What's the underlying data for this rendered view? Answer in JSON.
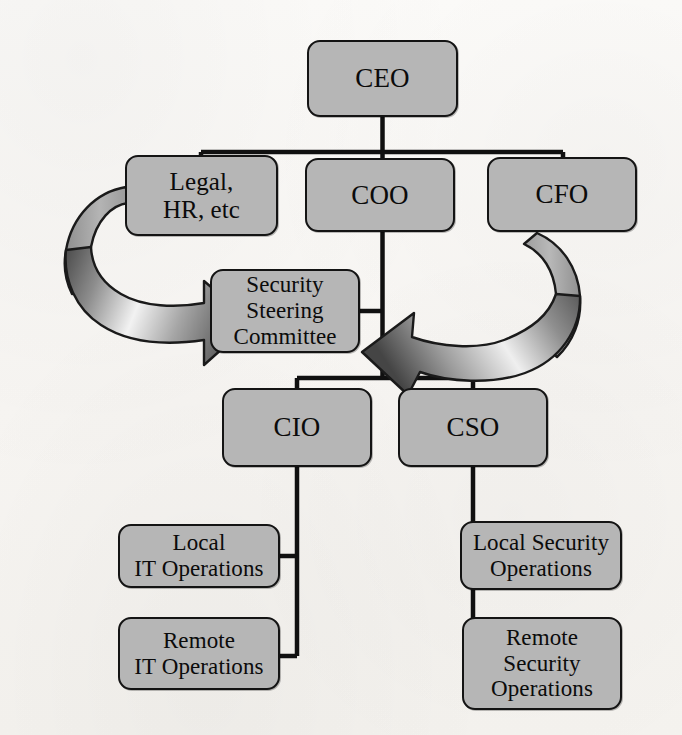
{
  "diagram": {
    "colors": {
      "node_fill": "#b6b6b6",
      "node_border": "#141414",
      "connector": "#101010",
      "arrow_outline": "#1a1a1a",
      "arrow_light": "#ffffff",
      "arrow_dark": "#3a3a3a",
      "background": "#fbfaf8"
    },
    "nodes": [
      {
        "id": "ceo",
        "label": "CEO",
        "level": 1
      },
      {
        "id": "legal",
        "label": "Legal,\nHR, etc",
        "level": 2
      },
      {
        "id": "coo",
        "label": "COO",
        "level": 2
      },
      {
        "id": "cfo",
        "label": "CFO",
        "level": 2
      },
      {
        "id": "ssc",
        "label": "Security\nSteering\nCommittee",
        "level": 3
      },
      {
        "id": "cio",
        "label": "CIO",
        "level": 4
      },
      {
        "id": "cso",
        "label": "CSO",
        "level": 4
      },
      {
        "id": "lit",
        "label": "Local\nIT Operations",
        "level": 5
      },
      {
        "id": "rit",
        "label": "Remote\nIT Operations",
        "level": 5
      },
      {
        "id": "lso",
        "label": "Local Security\nOperations",
        "level": 5
      },
      {
        "id": "rso",
        "label": "Remote\nSecurity\nOperations",
        "level": 5
      }
    ],
    "connectors": [
      {
        "from": "ceo",
        "to": "legal",
        "type": "orthogonal"
      },
      {
        "from": "ceo",
        "to": "coo",
        "type": "orthogonal"
      },
      {
        "from": "ceo",
        "to": "cfo",
        "type": "orthogonal"
      },
      {
        "from": "coo",
        "to": "ssc",
        "type": "orthogonal"
      },
      {
        "from": "coo",
        "to": "cio",
        "type": "orthogonal"
      },
      {
        "from": "coo",
        "to": "cso",
        "type": "orthogonal"
      },
      {
        "from": "cio",
        "to": "lit",
        "type": "orthogonal"
      },
      {
        "from": "cio",
        "to": "rit",
        "type": "orthogonal"
      },
      {
        "from": "cso",
        "to": "lso",
        "type": "orthogonal"
      },
      {
        "from": "cso",
        "to": "rso",
        "type": "orthogonal"
      }
    ],
    "flow_arrows": [
      {
        "id": "legal-to-ssc",
        "from": "legal",
        "to": "ssc",
        "direction": "right",
        "style": "curved-3d-block-arrow"
      },
      {
        "id": "cfo-to-ssc",
        "from": "cfo",
        "to": "ssc",
        "direction": "left",
        "style": "curved-3d-block-arrow"
      }
    ]
  }
}
